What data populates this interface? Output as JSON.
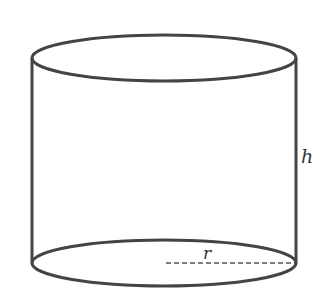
{
  "diagram": {
    "type": "cylinder",
    "labels": {
      "height": "h",
      "radius": "r"
    },
    "colors": {
      "stroke": "#444444",
      "background": "#ffffff"
    }
  }
}
